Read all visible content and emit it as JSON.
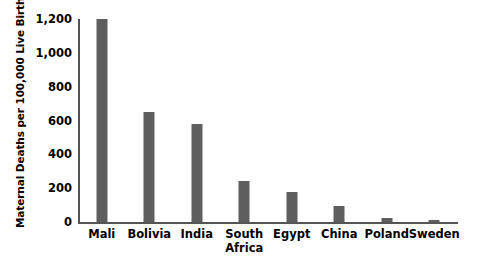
{
  "chart_data": {
    "type": "bar",
    "title": "",
    "xlabel": "",
    "ylabel": "Maternal Deaths per 100,000 Live Births",
    "categories": [
      "Mali",
      "Bolivia",
      "India",
      "South\nAfrica",
      "Egypt",
      "China",
      "Poland",
      "Sweden"
    ],
    "values": [
      1200,
      650,
      580,
      240,
      175,
      95,
      25,
      8
    ],
    "ylim": [
      0,
      1200
    ],
    "yticks": [
      0,
      200,
      400,
      600,
      800,
      1000,
      1200
    ],
    "ytick_labels": [
      "0",
      "200",
      "400",
      "600",
      "800",
      "1,000",
      "1,200"
    ],
    "grid": false,
    "legend": null,
    "bar_color": "#5e5e5e",
    "axis_color": "#555555",
    "background_color": "#ffffff"
  }
}
